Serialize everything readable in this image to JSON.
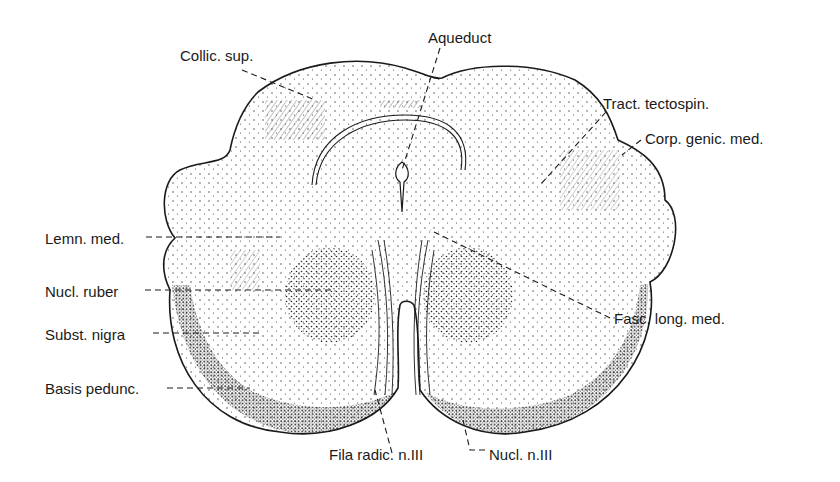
{
  "colors": {
    "ink": "#1a1a1a",
    "background": "#ffffff"
  },
  "labels": {
    "aqueduct": "Aqueduct",
    "collic_sup": "Collic. sup.",
    "tract_tectospin": "Tract. tectospin.",
    "corp_genic_med": "Corp. genic. med.",
    "lemn_med": "Lemn. med.",
    "nucl_ruber": "Nucl. ruber",
    "subst_nigra": "Subst. nigra",
    "basis_pedunc": "Basis pedunc.",
    "fasc_long_med": "Fasc. long. med.",
    "fila_radic": "Fila radic. n.III",
    "nucl_n3": "Nucl. n.III"
  }
}
